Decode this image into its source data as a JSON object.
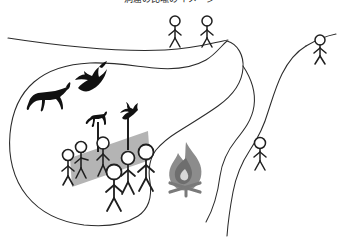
{
  "figure": {
    "title": "洞窟の比喩のイメージ",
    "title_note": "cropped-at-top-edge",
    "width": 339,
    "height": 240,
    "background_color": "#ffffff"
  },
  "colors": {
    "outline_stroke": "#2b2b2b",
    "silhouette_fill": "#111111",
    "screen_gray": "#b4b4b4",
    "fire_body_gray": "#8c8c8c",
    "fire_inner_gray": "#6e6e6e",
    "fire_core_light": "#d8d8d8",
    "log_gray": "#7a7a7a",
    "stick_figure_stroke": "#1f1f1f"
  },
  "scene": {
    "name": "allegory-of-the-cave",
    "upper_ground_line": {
      "label": "upper-world-ground-line",
      "description": "long gently curving horizon line across the top"
    },
    "cave_outline": {
      "label": "cave-chamber-outline",
      "description": "large closed rounded blob enclosing the prisoners"
    },
    "exit_path": {
      "label": "winding-exit-path",
      "description": "S-curved path leading from cave up to the outer world"
    }
  },
  "outside_figures": [
    {
      "id": "outside-figure-1",
      "label": "person on upper ground, left of pair",
      "x": 175,
      "y": 22
    },
    {
      "id": "outside-figure-2",
      "label": "person on upper ground, right of pair",
      "x": 198,
      "y": 22
    },
    {
      "id": "outside-figure-3",
      "label": "person on right hill above path",
      "x": 318,
      "y": 40
    }
  ],
  "path_figures": [
    {
      "id": "path-figure-1",
      "label": "person climbing the winding path",
      "x": 260,
      "y": 140
    }
  ],
  "cave_silhouettes": [
    {
      "id": "cave-shadow-horse",
      "label": "horse shadow on cave wall",
      "x": 46,
      "y": 95
    },
    {
      "id": "cave-shadow-bird",
      "label": "bird shadow on cave wall",
      "x": 85,
      "y": 80
    }
  ],
  "cave_screen": {
    "id": "cave-screen",
    "label": "gray slanted screen / low wall",
    "fill": "#b4b4b4"
  },
  "puppets": [
    {
      "id": "puppet-horse",
      "label": "horse cut-out carried on a stick",
      "x": 98,
      "y": 122
    },
    {
      "id": "puppet-bird",
      "label": "bird cut-out carried on a stick",
      "x": 128,
      "y": 118
    }
  ],
  "cave_figures": [
    {
      "id": "cave-figure-1",
      "label": "prisoner at far left behind screen",
      "x": 68,
      "y": 155
    },
    {
      "id": "cave-figure-2",
      "label": "prisoner holding horse puppet stick",
      "x": 80,
      "y": 148
    },
    {
      "id": "cave-figure-3",
      "label": "prisoner center-left behind screen",
      "x": 100,
      "y": 145
    },
    {
      "id": "cave-figure-4",
      "label": "prisoner front center",
      "x": 112,
      "y": 168
    },
    {
      "id": "cave-figure-5",
      "label": "prisoner holding bird puppet stick",
      "x": 128,
      "y": 160
    },
    {
      "id": "cave-figure-6",
      "label": "prisoner right of center",
      "x": 142,
      "y": 155
    }
  ],
  "campfire": {
    "id": "campfire",
    "label": "fire behind the prisoners",
    "x": 186,
    "y": 172
  }
}
